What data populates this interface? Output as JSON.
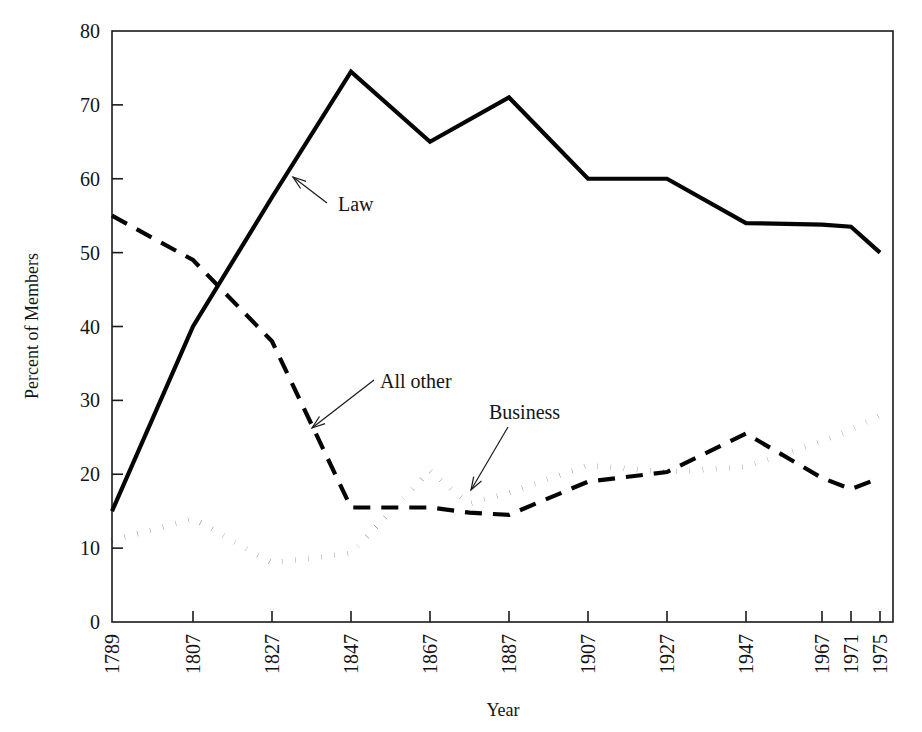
{
  "figure": {
    "background": "#ffffff",
    "ink": "#050505",
    "width": 922,
    "height": 732
  },
  "chart_data": {
    "type": "line",
    "title": "",
    "xlabel": "Year",
    "ylabel": "Percent of Members",
    "xlim": [
      1789,
      1975
    ],
    "ylim": [
      0,
      80
    ],
    "yticks": [
      0,
      10,
      20,
      30,
      40,
      50,
      60,
      70,
      80
    ],
    "ytick_labels": [
      "0",
      "10",
      "20",
      "30",
      "40",
      "50",
      "60",
      "70",
      "80"
    ],
    "xticks": [
      1789,
      1807,
      1827,
      1847,
      1867,
      1887,
      1907,
      1927,
      1947,
      1967,
      1971,
      1975
    ],
    "xtick_labels": [
      "1789",
      "1807",
      "1827",
      "1847",
      "1867",
      "1887",
      "1907",
      "1927",
      "1947",
      "1967",
      "1971",
      "1975"
    ],
    "grid": false,
    "legend": "none",
    "frame": "box",
    "series": [
      {
        "name": "Law",
        "style": "solid",
        "linewidth": 4.2,
        "x": [
          1789,
          1807,
          1827,
          1847,
          1867,
          1887,
          1907,
          1927,
          1947,
          1967,
          1971,
          1975
        ],
        "values": [
          15,
          40,
          57.5,
          74.5,
          65,
          71,
          60,
          60,
          54,
          53.8,
          53.5,
          50
        ]
      },
      {
        "name": "All other",
        "style": "dashed",
        "linewidth": 4.2,
        "dash": "17 11",
        "x": [
          1789,
          1807,
          1827,
          1847,
          1867,
          1877,
          1887,
          1907,
          1927,
          1947,
          1967,
          1971,
          1975
        ],
        "values": [
          55,
          49,
          38,
          15.5,
          15.5,
          14.8,
          14.5,
          19,
          20.3,
          25.5,
          19.5,
          18,
          19.5
        ]
      },
      {
        "name": "Business",
        "style": "dotted",
        "linewidth": 5.4,
        "dash": "0.2 13",
        "x": [
          1789,
          1807,
          1827,
          1847,
          1867,
          1877,
          1887,
          1907,
          1927,
          1947,
          1967,
          1971,
          1975
        ],
        "values": [
          11,
          14,
          8,
          9.3,
          20.5,
          16,
          17.5,
          21.2,
          20.3,
          21,
          24.5,
          26,
          28
        ]
      }
    ],
    "annotations": [
      {
        "text": "Law",
        "label_x": 338,
        "label_y": 211,
        "tail_x": 327,
        "tail_y": 203,
        "tip_x": 293,
        "tip_y": 177
      },
      {
        "text": "All other",
        "label_x": 380,
        "label_y": 388,
        "tail_x": 374,
        "tail_y": 380,
        "tip_x": 312,
        "tip_y": 428
      },
      {
        "text": "Business",
        "label_x": 489,
        "label_y": 419,
        "tail_x": 508,
        "tail_y": 427,
        "tip_x": 471,
        "tip_y": 490
      }
    ]
  }
}
